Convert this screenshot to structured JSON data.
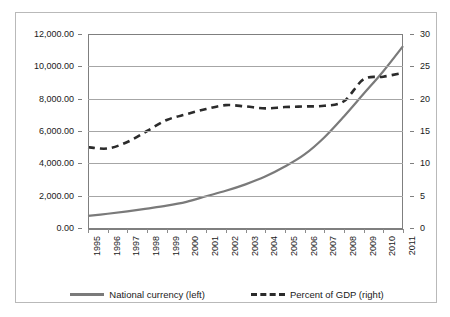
{
  "chart_data": {
    "type": "line",
    "title": "",
    "xlabel": "",
    "ylabel": "",
    "grid": true,
    "legend_position": "bottom",
    "categories": [
      "1995",
      "1996",
      "1997",
      "1998",
      "1999",
      "2000",
      "2001",
      "2002",
      "2003",
      "2004",
      "2005",
      "2006",
      "2007",
      "2008",
      "2009",
      "2010",
      "2011"
    ],
    "axes": {
      "left": {
        "label": "National currency",
        "ticks": [
          "0.00",
          "2,000.00",
          "4,000.00",
          "6,000.00",
          "8,000.00",
          "10,000.00",
          "12,000.00"
        ],
        "tick_values": [
          0,
          2000,
          4000,
          6000,
          8000,
          10000,
          12000
        ],
        "ylim": [
          0,
          12000
        ]
      },
      "right": {
        "label": "Percent of GDP",
        "ticks": [
          "0",
          "5",
          "10",
          "15",
          "20",
          "25",
          "30"
        ],
        "tick_values": [
          0,
          5,
          10,
          15,
          20,
          25,
          30
        ],
        "ylim": [
          0,
          30
        ]
      }
    },
    "series": [
      {
        "name": "National currency (left)",
        "axis": "left",
        "style": "solid",
        "color": "#7a7a7a",
        "values": [
          750,
          880,
          1030,
          1200,
          1380,
          1620,
          1960,
          2300,
          2700,
          3180,
          3800,
          4550,
          5600,
          6900,
          8300,
          9700,
          11250
        ]
      },
      {
        "name": "Percent of GDP (right)",
        "axis": "right",
        "style": "dashed",
        "color": "#2b2b2b",
        "values": [
          12.5,
          12.3,
          13.3,
          15.0,
          16.7,
          17.6,
          18.4,
          19.0,
          18.8,
          18.5,
          18.7,
          18.8,
          18.9,
          19.6,
          23.0,
          23.4,
          24.0
        ]
      }
    ],
    "legend": [
      {
        "label": "National currency (left)",
        "style": "solid",
        "color": "#7a7a7a"
      },
      {
        "label": "Percent of GDP (right)",
        "style": "dashed",
        "color": "#2b2b2b"
      }
    ]
  }
}
